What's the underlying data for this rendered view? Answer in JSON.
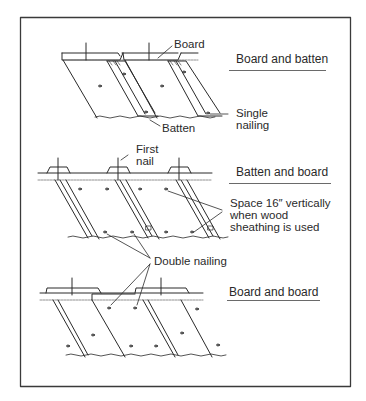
{
  "figure": {
    "frame_color": "#3a3a3a",
    "line_color": "#2a2a2a",
    "panels": [
      {
        "id": "board-and-batten",
        "title": "Board and batten",
        "labels": {
          "board": "Board",
          "batten": "Batten",
          "nailing": "Single\nnailing"
        }
      },
      {
        "id": "batten-and-board",
        "title": "Batten and board",
        "labels": {
          "first_nail": "First\nnail",
          "spacing_note": "Space 16″ vertically\nwhen wood\nsheathing is used",
          "nailing": "Double nailing"
        }
      },
      {
        "id": "board-and-board",
        "title": "Board and board",
        "labels": {}
      }
    ]
  }
}
